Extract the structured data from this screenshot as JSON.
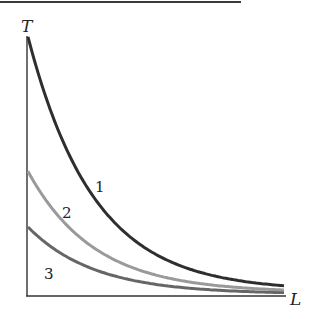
{
  "chart_data": {
    "type": "line",
    "title": "",
    "xlabel": "L",
    "ylabel": "T",
    "grid": false,
    "legend": "none (curves labeled inline)",
    "x": [
      0,
      0.5,
      1,
      1.5,
      2,
      2.5,
      3,
      3.5,
      3.9
    ],
    "series": [
      {
        "name": "1",
        "color": "#2e2e2e",
        "values": [
          1.0,
          0.468,
          0.219,
          0.103,
          0.048,
          0.022,
          0.011,
          0.005,
          0.002
        ]
      },
      {
        "name": "2",
        "color": "#9a9a9a",
        "values": [
          0.477,
          0.223,
          0.105,
          0.049,
          0.023,
          0.011,
          0.005,
          0.002,
          0.001
        ]
      },
      {
        "name": "3",
        "color": "#666666",
        "values": [
          0.264,
          0.124,
          0.058,
          0.027,
          0.013,
          0.006,
          0.003,
          0.001,
          0.001
        ]
      }
    ],
    "ylim": [
      0,
      1.05
    ],
    "xlim": [
      0,
      4
    ]
  },
  "labels": {
    "y_axis": "T",
    "x_axis": "L",
    "curve1": "1",
    "curve2": "2",
    "curve3": "3"
  },
  "geometry": {
    "origin_x": 27,
    "origin_y": 296,
    "end_x": 285,
    "curve1_top": 38,
    "curve2_top": 173,
    "curve3_top": 228,
    "lambda_px": 66
  },
  "colors": {
    "axis": "#333333",
    "header_rule": "#3a3a3a",
    "curve1": "#2e2e2e",
    "curve2": "#9a9a9a",
    "curve3": "#666666"
  }
}
